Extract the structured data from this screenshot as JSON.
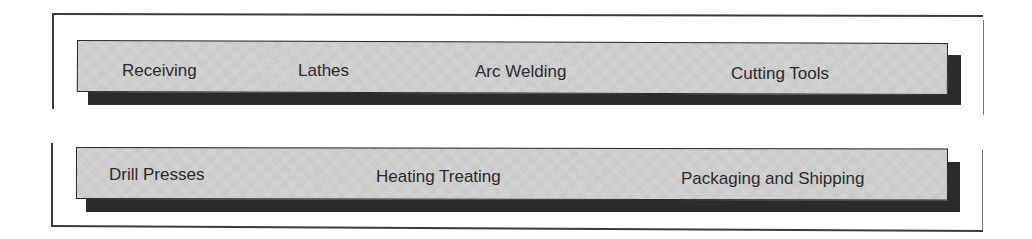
{
  "diagram": {
    "type": "facility-layout",
    "rows": [
      {
        "name": "top-row",
        "departments": [
          {
            "label": "Receiving"
          },
          {
            "label": "Lathes"
          },
          {
            "label": "Arc Welding"
          },
          {
            "label": "Cutting Tools"
          }
        ]
      },
      {
        "name": "bottom-row",
        "departments": [
          {
            "label": "Drill Presses"
          },
          {
            "label": "Heating Treating"
          },
          {
            "label": "Packaging and Shipping"
          }
        ]
      }
    ],
    "colors": {
      "bar_fill": "#cfcfcf",
      "bar_border": "#2a2a2a",
      "shadow": "#2b2b2b",
      "frame": "#3a3a3a",
      "text": "#2a2a2a"
    }
  }
}
